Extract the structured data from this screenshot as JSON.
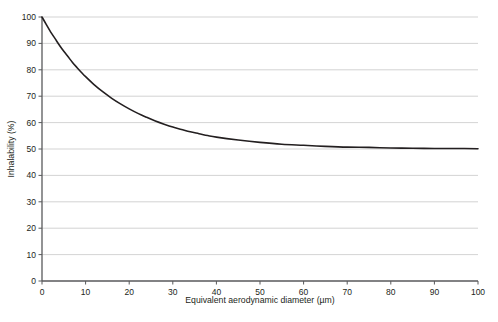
{
  "chart_data": {
    "type": "line",
    "title": "",
    "subtitle": "",
    "xlabel": "Equivalent aerodynamic diameter (µm)",
    "ylabel": "Inhalability (%)",
    "xlim": [
      0,
      100
    ],
    "ylim": [
      0,
      100
    ],
    "xticks": [
      0,
      10,
      20,
      30,
      40,
      50,
      60,
      70,
      80,
      90,
      100
    ],
    "yticks": [
      0,
      10,
      20,
      30,
      40,
      50,
      60,
      70,
      80,
      90,
      100
    ],
    "xticklabels": [
      "0",
      "10",
      "20",
      "30",
      "40",
      "50",
      "60",
      "70",
      "80",
      "90",
      "100"
    ],
    "yticklabels": [
      "0",
      "10",
      "20",
      "30",
      "40",
      "50",
      "60",
      "70",
      "80",
      "90",
      "100"
    ],
    "grid": {
      "horizontal": true,
      "vertical": false,
      "color": "#c8c8c8"
    },
    "legend": {
      "visible": false,
      "position": "none",
      "entries": []
    },
    "annotations": [],
    "series": [
      {
        "name": "Inhalability",
        "color": "#231f20",
        "line_width": 1.6,
        "x": [
          0,
          1,
          2,
          3,
          4,
          5,
          6,
          7,
          8,
          9,
          10,
          12,
          14,
          16,
          18,
          20,
          22,
          24,
          26,
          28,
          30,
          32,
          34,
          36,
          38,
          40,
          45,
          50,
          55,
          60,
          65,
          70,
          75,
          80,
          85,
          90,
          95,
          100
        ],
        "values": [
          100.0,
          97.1,
          94.3,
          91.8,
          89.3,
          87.0,
          84.9,
          82.8,
          80.9,
          79.1,
          77.4,
          74.3,
          71.6,
          69.2,
          67.1,
          65.2,
          63.5,
          62.0,
          60.6,
          59.4,
          58.3,
          57.4,
          56.5,
          55.8,
          55.1,
          54.5,
          53.4,
          52.5,
          51.8,
          51.4,
          51.0,
          50.7,
          50.6,
          50.4,
          50.3,
          50.2,
          50.2,
          50.1
        ]
      }
    ]
  },
  "axis": {
    "x_label": "Equivalent aerodynamic diameter (µm)",
    "y_label": "Inhalability (%)"
  }
}
